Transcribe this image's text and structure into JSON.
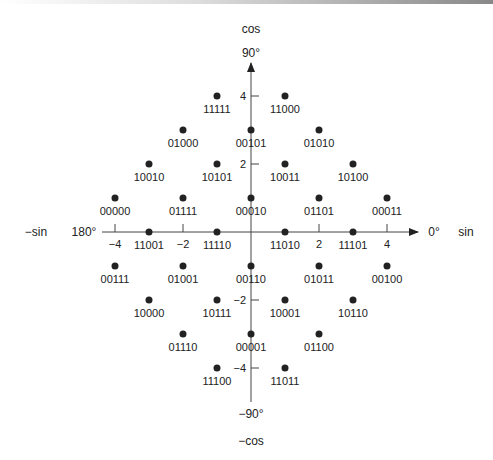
{
  "chart_data": {
    "type": "scatter",
    "axes": {
      "x_positive_label": "sin",
      "x_negative_label": "−sin",
      "y_positive_label": "cos",
      "y_negative_label": "−cos",
      "angle_right": "0°",
      "angle_left": "180°",
      "angle_top": "90°",
      "angle_bottom": "−90°",
      "x_ticks": [
        -4,
        -2,
        2,
        4
      ],
      "y_ticks": [
        4,
        2,
        -2,
        -4
      ],
      "x_tick_labels": [
        "−4",
        "−2",
        "2",
        "4"
      ],
      "y_tick_labels": [
        "4",
        "2",
        "−2",
        "−4"
      ],
      "xlim": [
        -4.5,
        4.5
      ],
      "ylim": [
        -4.5,
        4.5
      ]
    },
    "points": [
      {
        "x": -1,
        "y": 4,
        "label": "11111"
      },
      {
        "x": 1,
        "y": 4,
        "label": "11000"
      },
      {
        "x": -2,
        "y": 3,
        "label": "01000"
      },
      {
        "x": 0,
        "y": 3,
        "label": "00101"
      },
      {
        "x": 2,
        "y": 3,
        "label": "01010"
      },
      {
        "x": -3,
        "y": 2,
        "label": "10010"
      },
      {
        "x": -1,
        "y": 2,
        "label": "10101"
      },
      {
        "x": 1,
        "y": 2,
        "label": "10011"
      },
      {
        "x": 3,
        "y": 2,
        "label": "10100"
      },
      {
        "x": -4,
        "y": 1,
        "label": "00000"
      },
      {
        "x": -2,
        "y": 1,
        "label": "01111"
      },
      {
        "x": 0,
        "y": 1,
        "label": "00010"
      },
      {
        "x": 2,
        "y": 1,
        "label": "01101"
      },
      {
        "x": 4,
        "y": 1,
        "label": "00011"
      },
      {
        "x": -3,
        "y": 0,
        "label": "11001"
      },
      {
        "x": -1,
        "y": 0,
        "label": "11110"
      },
      {
        "x": 1,
        "y": 0,
        "label": "11010"
      },
      {
        "x": 3,
        "y": 0,
        "label": "11101"
      },
      {
        "x": -4,
        "y": -1,
        "label": "00111"
      },
      {
        "x": -2,
        "y": -1,
        "label": "01001"
      },
      {
        "x": 0,
        "y": -1,
        "label": "00110"
      },
      {
        "x": 2,
        "y": -1,
        "label": "01011"
      },
      {
        "x": 4,
        "y": -1,
        "label": "00100"
      },
      {
        "x": -3,
        "y": -2,
        "label": "10000"
      },
      {
        "x": -1,
        "y": -2,
        "label": "10111"
      },
      {
        "x": 1,
        "y": -2,
        "label": "10001"
      },
      {
        "x": 3,
        "y": -2,
        "label": "10110"
      },
      {
        "x": -2,
        "y": -3,
        "label": "01110"
      },
      {
        "x": 0,
        "y": -3,
        "label": "00001"
      },
      {
        "x": 2,
        "y": -3,
        "label": "01100"
      },
      {
        "x": -1,
        "y": -4,
        "label": "11100"
      },
      {
        "x": 1,
        "y": -4,
        "label": "11011"
      }
    ],
    "grid": false,
    "legend": null
  }
}
